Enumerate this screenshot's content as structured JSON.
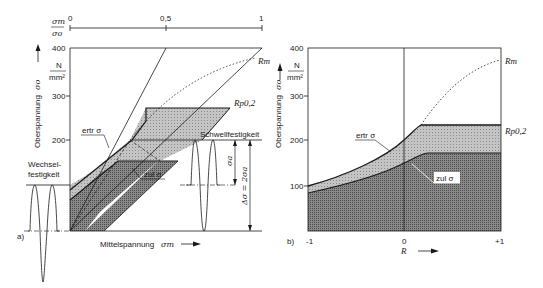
{
  "figure_a": {
    "panel_label": "a)",
    "top_scale": {
      "label_num": "σm",
      "label_den": "σo",
      "ticks": [
        "0",
        "0,5",
        "1"
      ]
    },
    "y_axis": {
      "title": "Oberspannung",
      "symbol": "σo",
      "unit_num": "N",
      "unit_den": "mm²",
      "ticks": [
        "400",
        "300",
        "200"
      ]
    },
    "x_axis": {
      "title": "Mittelspannung",
      "symbol": "σm"
    },
    "labels": {
      "rm": "Rm",
      "rp02": "Rp0,2",
      "schwell": "Schwellfestigkeit",
      "wechsel_line1": "Wechsel-",
      "wechsel_line2": "festigkeit",
      "ertr": "ertr σ",
      "zul": "zul σ",
      "sigma_a": "σa",
      "delta_sigma": "Δσ = 2σa"
    }
  },
  "figure_b": {
    "panel_label": "b)",
    "y_axis": {
      "title": "Oberspannung",
      "symbol": "σo",
      "unit_num": "N",
      "unit_den": "mm²",
      "ticks": [
        "400",
        "300",
        "200",
        "100"
      ]
    },
    "x_axis": {
      "symbol": "R",
      "ticks": [
        "-1",
        "0",
        "+1"
      ]
    },
    "labels": {
      "rm": "Rm",
      "rp02": "Rp0,2",
      "ertr": "ertr σ",
      "zul": "zul σ"
    }
  },
  "colors": {
    "line": "#1a1a1a",
    "light_fill": "#bdbdbd",
    "dark_fill": "#7a7a7a",
    "background": "#ffffff"
  }
}
